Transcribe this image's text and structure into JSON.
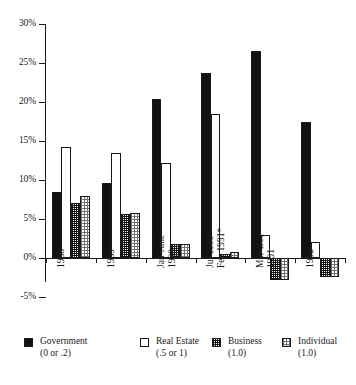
{
  "chart_data": {
    "type": "bar",
    "title": "",
    "subtitle": "",
    "xlabel": "",
    "ylabel": "",
    "ylim": [
      -5,
      30
    ],
    "grid": false,
    "legend_position": "bottom",
    "ytick_labels": [
      "30%",
      "25%",
      "20%",
      "15%",
      "10%",
      "5%",
      "0%",
      "-5%"
    ],
    "ytick_values": [
      30,
      25,
      20,
      15,
      10,
      5,
      0,
      -5
    ],
    "categories": [
      "1988",
      "1989",
      "Jan-June\n1990",
      "Jul 1990-\nFeb 1991*",
      "Mar-Dec\n1991",
      "1992"
    ],
    "category_lines": [
      [
        "1988"
      ],
      [
        "1989"
      ],
      [
        "Jan-June",
        "1990"
      ],
      [
        "Jul 1990-",
        "Feb 1991*"
      ],
      [
        "Mar-Dec",
        "1991"
      ],
      [
        "1992"
      ]
    ],
    "series": [
      {
        "name": "Government",
        "note": "(0 or .2)",
        "pattern": "solid-black",
        "values": [
          8.4,
          9.6,
          20.4,
          23.7,
          26.6,
          17.5
        ]
      },
      {
        "name": "Real Estate",
        "note": "(.5 or 1)",
        "pattern": "white",
        "values": [
          14.2,
          13.5,
          12.2,
          18.4,
          3.0,
          2.0
        ]
      },
      {
        "name": "Business",
        "note": "(1.0)",
        "pattern": "dark-checker",
        "values": [
          7.0,
          5.6,
          1.8,
          0.5,
          -2.8,
          -2.4
        ]
      },
      {
        "name": "Individual",
        "note": "(1.0)",
        "pattern": "light-dotted",
        "values": [
          8.0,
          5.8,
          1.8,
          0.8,
          -2.8,
          -2.4
        ]
      }
    ]
  },
  "legend": {
    "items": [
      {
        "label": "Government",
        "sub": "(0 or .2)"
      },
      {
        "label": "Real Estate",
        "sub": "(.5 or 1)"
      },
      {
        "label": "Business",
        "sub": "(1.0)"
      },
      {
        "label": "Individual",
        "sub": "(1.0)"
      }
    ]
  },
  "colors": {
    "axis": "#1a1a1a",
    "government": "#111111",
    "real_estate": "#ffffff",
    "business": "#121212",
    "individual": "#6f6f6f",
    "background": "#ffffff"
  }
}
